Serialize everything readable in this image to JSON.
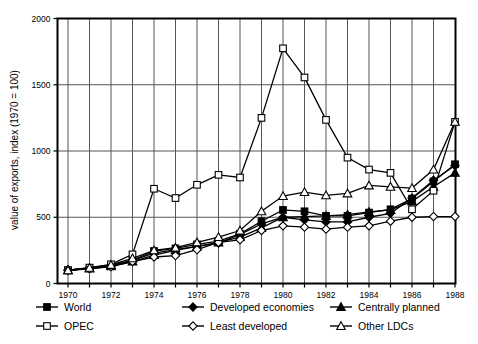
{
  "chart_data": {
    "type": "line",
    "title": "",
    "xlabel": "",
    "ylabel": "value of exports, index (1970 = 100)",
    "xlim": [
      1970,
      1988
    ],
    "ylim": [
      0,
      2000
    ],
    "yticks": [
      0,
      500,
      1000,
      1500,
      2000
    ],
    "ytick_labels": [
      "0",
      "500",
      "1000",
      "1500",
      "2000"
    ],
    "xticks": [
      1970,
      1971,
      1972,
      1973,
      1974,
      1975,
      1976,
      1977,
      1978,
      1979,
      1980,
      1981,
      1982,
      1983,
      1984,
      1985,
      1986,
      1987,
      1988
    ],
    "xtick_labels": [
      "1970",
      "",
      "1972",
      "",
      "1974",
      "",
      "1976",
      "",
      "1978",
      "",
      "1980",
      "",
      "1982",
      "",
      "1984",
      "",
      "1986",
      "",
      "1988"
    ],
    "grid": true,
    "legend_position": "below",
    "x": [
      1970,
      1971,
      1972,
      1973,
      1974,
      1975,
      1976,
      1977,
      1978,
      1979,
      1980,
      1981,
      1982,
      1983,
      1984,
      1985,
      1986,
      1987,
      1988
    ],
    "series": [
      {
        "name": "World",
        "marker": "filled-square",
        "values": [
          100,
          115,
          135,
          175,
          245,
          265,
          295,
          320,
          375,
          470,
          555,
          545,
          510,
          510,
          535,
          560,
          640,
          770,
          900
        ]
      },
      {
        "name": "Developed economies",
        "marker": "filled-diamond",
        "values": [
          100,
          115,
          135,
          175,
          230,
          255,
          280,
          305,
          370,
          450,
          500,
          480,
          465,
          465,
          500,
          530,
          645,
          780,
          890
        ]
      },
      {
        "name": "Centrally planned",
        "marker": "filled-triangle",
        "values": [
          100,
          113,
          130,
          165,
          215,
          250,
          280,
          310,
          350,
          420,
          500,
          505,
          510,
          520,
          540,
          555,
          620,
          730,
          835
        ]
      },
      {
        "name": "OPEC",
        "marker": "open-square",
        "values": [
          100,
          120,
          145,
          220,
          715,
          645,
          745,
          820,
          800,
          1250,
          1775,
          1555,
          1235,
          950,
          860,
          835,
          560,
          700,
          1220
        ]
      },
      {
        "name": "Least developed",
        "marker": "open-diamond",
        "values": [
          100,
          110,
          128,
          165,
          200,
          210,
          255,
          310,
          330,
          400,
          435,
          425,
          410,
          425,
          435,
          470,
          500,
          505,
          505
        ]
      },
      {
        "name": "Other LDCs",
        "marker": "open-triangle",
        "values": [
          100,
          118,
          140,
          190,
          250,
          270,
          310,
          350,
          400,
          545,
          660,
          690,
          665,
          680,
          740,
          730,
          720,
          860,
          1220
        ]
      }
    ]
  },
  "legend": {
    "entries": [
      {
        "label": "World",
        "marker": "filled-square"
      },
      {
        "label": "Developed economies",
        "marker": "filled-diamond"
      },
      {
        "label": "Centrally planned",
        "marker": "filled-triangle"
      },
      {
        "label": "OPEC",
        "marker": "open-square"
      },
      {
        "label": "Least developed",
        "marker": "open-diamond"
      },
      {
        "label": "Other LDCs",
        "marker": "open-triangle"
      }
    ]
  },
  "colors": {
    "line": "#000000",
    "grid": "#555555",
    "axis": "#000000",
    "background": "#ffffff",
    "marker_fill_open": "#ffffff"
  }
}
